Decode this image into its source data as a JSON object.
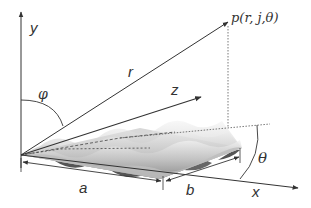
{
  "diagram": {
    "type": "3d-coordinate-system-with-wavy-surface",
    "labels": {
      "y_axis": "y",
      "z_axis": "z",
      "x_axis": "x",
      "radius": "r",
      "polar_angle": "φ",
      "azimuth_angle": "θ",
      "point": "p(r, j,θ)",
      "length_a": "a",
      "width_b": "b"
    },
    "colors": {
      "line": "#333333",
      "dotted": "#555555",
      "surface_light": "#e6e6e6",
      "surface_mid": "#b5b5b5",
      "surface_dark": "#555555"
    }
  }
}
